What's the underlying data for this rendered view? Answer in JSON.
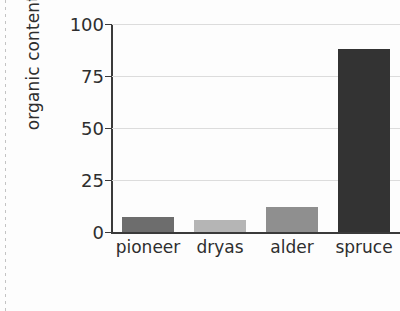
{
  "chart_data": {
    "type": "bar",
    "title": "",
    "xlabel": "",
    "ylabel": "organic content (mg/g)",
    "categories": [
      "pioneer",
      "dryas",
      "alder",
      "spruce"
    ],
    "values": [
      7,
      6,
      12,
      88
    ],
    "series": [
      {
        "name": "organic content",
        "values": [
          7,
          6,
          12,
          88
        ]
      }
    ],
    "ylim": [
      0,
      100
    ],
    "yticks": [
      0,
      25,
      50,
      75,
      100
    ],
    "ytick_labels": [
      "0",
      "25",
      "50",
      "75",
      "100"
    ],
    "grid": "horizontal",
    "legend": "none",
    "bar_colors": [
      "#6d6d6d",
      "#b5b5b5",
      "#8f8f8f",
      "#333333"
    ],
    "axis_color": "#3a3a3a",
    "grid_color": "#dcdcdc",
    "text_color": "#2e2e2e",
    "background": "#fdfdfd"
  }
}
